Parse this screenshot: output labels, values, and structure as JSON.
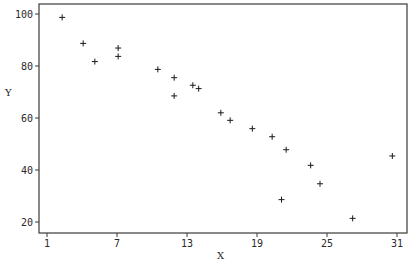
{
  "chart_data": {
    "type": "scatter",
    "title": "",
    "xlabel": "X",
    "ylabel": "Y",
    "marker": "+",
    "grid": false,
    "legend": null,
    "xlim": [
      0.3,
      31.8
    ],
    "ylim": [
      16.2,
      103.8
    ],
    "xticks": [
      1,
      7,
      13,
      19,
      25,
      31
    ],
    "yticks": [
      20,
      40,
      60,
      80,
      100
    ],
    "x": [
      2.3,
      4.1,
      5.1,
      7.1,
      7.1,
      10.5,
      11.9,
      11.9,
      13.5,
      14.0,
      15.9,
      16.7,
      18.6,
      20.3,
      21.5,
      21.1,
      23.6,
      24.4,
      27.2,
      30.6
    ],
    "y": [
      98.7,
      88.7,
      81.7,
      86.9,
      83.7,
      78.7,
      75.5,
      68.5,
      72.6,
      71.3,
      62.0,
      59.1,
      55.9,
      52.8,
      47.8,
      28.6,
      41.8,
      34.7,
      21.4,
      45.4
    ]
  },
  "colors": {
    "background": "#ffffff",
    "axis": "#3a3a3a",
    "marker": "#1a1a1a"
  }
}
